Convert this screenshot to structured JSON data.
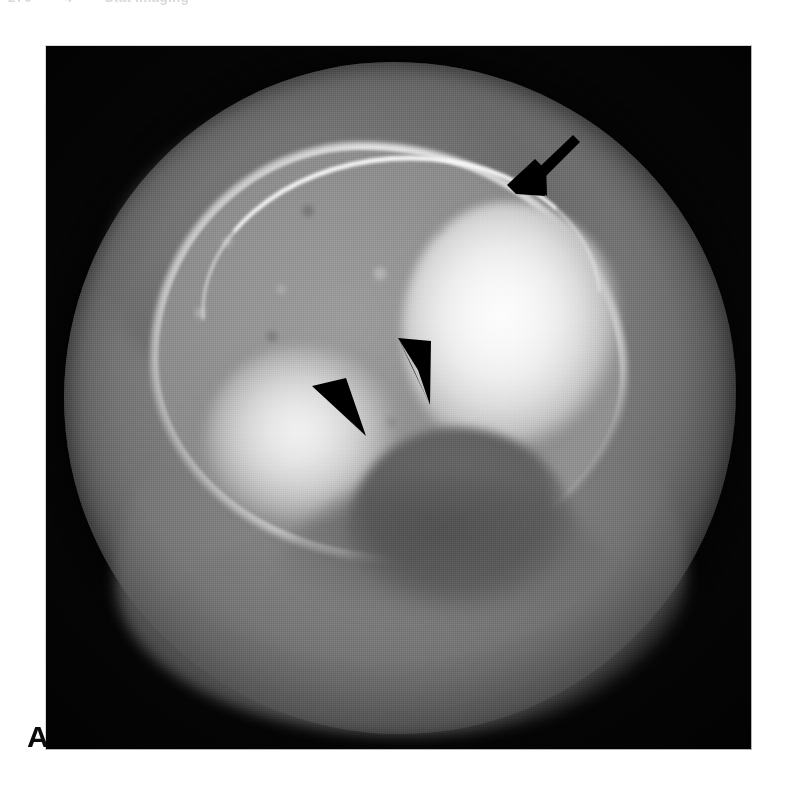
{
  "page": {
    "background_color": "#ffffff",
    "width": 791,
    "height": 789
  },
  "running_head": {
    "page_number": "270",
    "separator": "•",
    "section_number": "4",
    "title": "Stat Imaging"
  },
  "figure": {
    "panel_label": "A",
    "modality": "CT",
    "plane": "axial",
    "frame": {
      "x": 45,
      "y": 45,
      "width": 707,
      "height": 705,
      "background_color": "#050505",
      "border_color": "#d8d8d8"
    },
    "grayscale": {
      "air": "#060606",
      "soft_tissue": "#8a8a8a",
      "muscle": "#7c7c7c",
      "marrow": "#949494",
      "cortex": "#f4f4f4",
      "sclerosis": "#fdfdfd",
      "notch": "#646464"
    },
    "annotations": [
      {
        "id": "arrow-cortical-break",
        "type": "arrow",
        "color": "#000000",
        "tail_x": 573,
        "tail_y": 134,
        "tip_x": 526,
        "tip_y": 181,
        "direction": "down-left"
      },
      {
        "id": "arrowhead-right-margin",
        "type": "arrowhead",
        "color": "#000000",
        "tip_x": 429,
        "tip_y": 402,
        "base_x": 404,
        "base_y": 341,
        "direction": "down"
      },
      {
        "id": "arrowhead-left-margin",
        "type": "arrowhead",
        "color": "#000000",
        "tip_x": 363,
        "tip_y": 433,
        "base_x": 317,
        "base_y": 389,
        "direction": "down-right"
      }
    ]
  }
}
